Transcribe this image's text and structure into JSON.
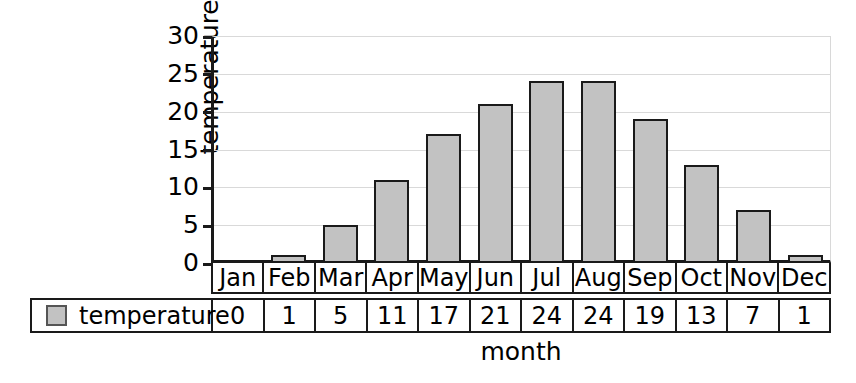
{
  "chart_data": {
    "type": "bar",
    "title": "",
    "categories": [
      "Jan",
      "Feb",
      "Mar",
      "Apr",
      "May",
      "Jun",
      "Jul",
      "Aug",
      "Sep",
      "Oct",
      "Nov",
      "Dec"
    ],
    "values": [
      0,
      1,
      5,
      11,
      17,
      21,
      24,
      24,
      19,
      13,
      7,
      1
    ],
    "series": [
      {
        "name": "temperature",
        "values": [
          0,
          1,
          5,
          11,
          17,
          21,
          24,
          24,
          19,
          13,
          7,
          1
        ]
      }
    ],
    "xlabel": "month",
    "ylabel": "temperature",
    "ylim": [
      0,
      30
    ],
    "yticks": [
      0,
      5,
      10,
      15,
      20,
      25,
      30
    ],
    "ytick_labels": [
      "0",
      "5",
      "10",
      "15",
      "20",
      "25",
      "30"
    ],
    "grid": true,
    "legend_position": "bottom-left",
    "bar_fill_color": "#c2c2c2",
    "bar_border_color": "#1a1a1a",
    "gridline_color": "#d9d9d9",
    "axis_color": "#1a1a1a"
  },
  "axes": {
    "y_title": "temperature",
    "x_title": "month",
    "y_ticks": [
      {
        "label": "30",
        "value": 30
      },
      {
        "label": "25",
        "value": 25
      },
      {
        "label": "20",
        "value": 20
      },
      {
        "label": "15",
        "value": 15
      },
      {
        "label": "10",
        "value": 10
      },
      {
        "label": "5",
        "value": 5
      },
      {
        "label": "0",
        "value": 0
      }
    ]
  },
  "month_header": {
    "cells": [
      "Jan",
      "Feb",
      "Mar",
      "Apr",
      "May",
      "Jun",
      "Jul",
      "Aug",
      "Sep",
      "Oct",
      "Nov",
      "Dec"
    ]
  },
  "data_table": {
    "legend_label": "temperature",
    "legend_swatch_color": "#c2c2c2",
    "values": [
      "0",
      "1",
      "5",
      "11",
      "17",
      "21",
      "24",
      "24",
      "19",
      "13",
      "7",
      "1"
    ]
  }
}
